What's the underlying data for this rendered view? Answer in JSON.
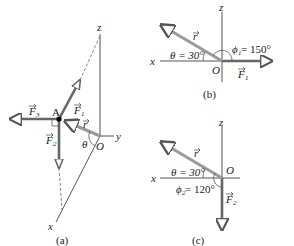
{
  "panels": {
    "a": {
      "caption": "(a)",
      "axes": {
        "z": "z",
        "y": "y",
        "x": "x"
      },
      "origin": "O",
      "point": "A",
      "vectors": {
        "F1": "F",
        "F1_sub": "1",
        "F2": "F",
        "F2_sub": "2",
        "F3": "F",
        "F3_sub": "3",
        "r": "r"
      },
      "angle": "θ"
    },
    "b": {
      "caption": "(b)",
      "axes": {
        "z": "z",
        "x": "x"
      },
      "origin": "O",
      "vectors": {
        "F1": "F",
        "F1_sub": "1",
        "r": "r"
      },
      "theta_label": "θ = 30°",
      "phi_label": "ϕ",
      "phi_sub": "1",
      "phi_value": " = 150°"
    },
    "c": {
      "caption": "(c)",
      "axes": {
        "z": "z",
        "x": "x"
      },
      "origin": "O",
      "vectors": {
        "F2": "F",
        "F2_sub": "2",
        "r": "r"
      },
      "theta_label": "θ = 30°",
      "phi_label": "ϕ",
      "phi_sub": "2",
      "phi_value": " = 120°"
    }
  },
  "colors": {
    "force": "#666666",
    "r_vector": "#9a9a9a",
    "axis": "#555555"
  }
}
